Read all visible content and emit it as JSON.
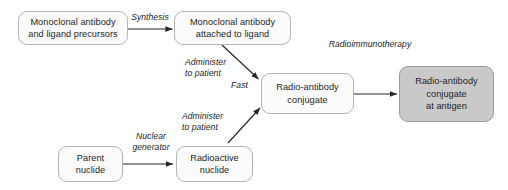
{
  "diagram": {
    "canvas": {
      "width": 508,
      "height": 190,
      "background": "#ffffff"
    },
    "colors": {
      "node_fill": "#fbfbfb",
      "node_fill_highlight": "#c9c9c9",
      "node_border": "#b4b4b4",
      "node_border_highlight": "#9a9a9a",
      "text": "#1d1d1d",
      "edge": "#262626"
    },
    "nodes": [
      {
        "id": "precursors",
        "label": "Monoclonal antibody\nand ligand precursors",
        "highlight": false
      },
      {
        "id": "antibody-ligand",
        "label": "Monoclonal antibody\nattached to ligand",
        "highlight": false
      },
      {
        "id": "conjugate",
        "label": "Radio-antibody\nconjugate",
        "highlight": false
      },
      {
        "id": "conjugate-at-antigen",
        "label": "Radio-antibody\nconjugate\nat antigen",
        "highlight": true
      },
      {
        "id": "parent-nuclide",
        "label": "Parent\nnuclide",
        "highlight": false
      },
      {
        "id": "radioactive-nuclide",
        "label": "Radioactive\nnuclide",
        "highlight": false
      }
    ],
    "edge_labels": [
      {
        "id": "synthesis",
        "text": "Synthesis"
      },
      {
        "id": "administer-top",
        "text": "Administer\nto patient"
      },
      {
        "id": "fast",
        "text": "Fast"
      },
      {
        "id": "administer-bottom",
        "text": "Administer\nto patient"
      },
      {
        "id": "nuclear-generator",
        "text": "Nuclear\ngenerator"
      },
      {
        "id": "radioimmunotherapy",
        "text": "Radioimmunotherapy"
      }
    ],
    "edges": [
      {
        "from": "precursors",
        "to": "antibody-ligand",
        "label": "Synthesis"
      },
      {
        "from": "antibody-ligand",
        "to": "conjugate",
        "label": "Administer to patient"
      },
      {
        "from": "radioactive-nuclide",
        "to": "conjugate",
        "label": "Administer to patient"
      },
      {
        "from": "parent-nuclide",
        "to": "radioactive-nuclide",
        "label": "Nuclear generator"
      },
      {
        "from": "conjugate",
        "to": "conjugate-at-antigen",
        "label": "Radioimmunotherapy"
      }
    ]
  }
}
